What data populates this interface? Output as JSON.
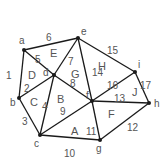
{
  "diagram": {
    "type": "planar-graph",
    "vertices": [
      {
        "id": "a",
        "label": "a"
      },
      {
        "id": "b",
        "label": "b"
      },
      {
        "id": "c",
        "label": "c"
      },
      {
        "id": "d",
        "label": "d"
      },
      {
        "id": "e",
        "label": "e"
      },
      {
        "id": "f",
        "label": "f"
      },
      {
        "id": "g",
        "label": "g"
      },
      {
        "id": "h",
        "label": "h"
      },
      {
        "id": "i",
        "label": "i"
      }
    ],
    "edges": [
      {
        "label": "1",
        "from": "a",
        "to": "b"
      },
      {
        "label": "2",
        "from": "b",
        "to": "d"
      },
      {
        "label": "3",
        "from": "b",
        "to": "c"
      },
      {
        "label": "4",
        "from": "c",
        "to": "d"
      },
      {
        "label": "5",
        "from": "a",
        "to": "d"
      },
      {
        "label": "6",
        "from": "a",
        "to": "e"
      },
      {
        "label": "7",
        "from": "d",
        "to": "e"
      },
      {
        "label": "8",
        "from": "d",
        "to": "f"
      },
      {
        "label": "9",
        "from": "c",
        "to": "f"
      },
      {
        "label": "10",
        "from": "c",
        "to": "g"
      },
      {
        "label": "11",
        "from": "f",
        "to": "g"
      },
      {
        "label": "12",
        "from": "g",
        "to": "h"
      },
      {
        "label": "13",
        "from": "f",
        "to": "h"
      },
      {
        "label": "14",
        "from": "e",
        "to": "f"
      },
      {
        "label": "15",
        "from": "e",
        "to": "i"
      },
      {
        "label": "16",
        "from": "f",
        "to": "i"
      },
      {
        "label": "17",
        "from": "i",
        "to": "h"
      }
    ],
    "faces": [
      {
        "label": "A",
        "vertices": [
          "c",
          "f",
          "g"
        ]
      },
      {
        "label": "B",
        "vertices": [
          "c",
          "d",
          "f"
        ]
      },
      {
        "label": "C",
        "vertices": [
          "b",
          "c",
          "d"
        ]
      },
      {
        "label": "D",
        "vertices": [
          "a",
          "b",
          "d"
        ]
      },
      {
        "label": "E",
        "vertices": [
          "a",
          "d",
          "e"
        ]
      },
      {
        "label": "F",
        "vertices": [
          "f",
          "g",
          "h"
        ]
      },
      {
        "label": "G",
        "vertices": [
          "d",
          "e",
          "f"
        ]
      },
      {
        "label": "H",
        "vertices": [
          "e",
          "f",
          "i"
        ]
      },
      {
        "label": "J",
        "vertices": [
          "f",
          "i",
          "h"
        ]
      }
    ]
  }
}
